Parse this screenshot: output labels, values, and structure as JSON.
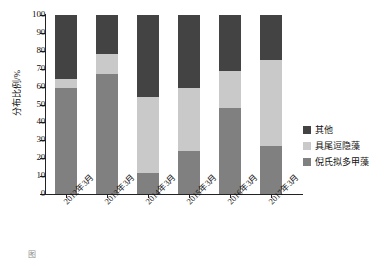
{
  "chart_data": {
    "type": "bar",
    "stacked": true,
    "title": "",
    "xlabel": "",
    "ylabel": "分布比例/%",
    "ylim": [
      0,
      100
    ],
    "ytick_step": 10,
    "grid": false,
    "legend_position": "right",
    "categories": [
      "2012年3月",
      "2013年3月",
      "2014年3月",
      "2015年3月",
      "2016年3月",
      "2017年3月"
    ],
    "ytick_labels": [
      "100",
      "90",
      "80",
      "70",
      "60",
      "50",
      "40",
      "30",
      "20",
      "10",
      "0"
    ],
    "series": [
      {
        "name": "倪氏拟多甲藻",
        "color": "#808080",
        "values": [
          59,
          67,
          12,
          24,
          48,
          27
        ]
      },
      {
        "name": "具尾逗隐藻",
        "color": "#c9c9c9",
        "values": [
          5,
          11,
          42,
          35,
          21,
          48
        ]
      },
      {
        "name": "其他",
        "color": "#434343",
        "values": [
          36,
          22,
          46,
          41,
          31,
          25
        ]
      }
    ],
    "legend_entries": [
      {
        "label": "其他",
        "color": "#434343"
      },
      {
        "label": "具尾逗隐藻",
        "color": "#c9c9c9"
      },
      {
        "label": "倪氏拟多甲藻",
        "color": "#808080"
      }
    ]
  },
  "caption": "图"
}
